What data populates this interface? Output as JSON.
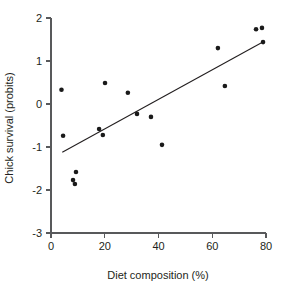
{
  "chart_data": {
    "type": "scatter",
    "title": "",
    "xlabel": "Diet composition (%)",
    "ylabel": "Chick survival (probits)",
    "xlim": [
      0,
      80
    ],
    "ylim": [
      -3,
      2
    ],
    "xticks": [
      0,
      20,
      40,
      60,
      80
    ],
    "xtick_labels": [
      "0",
      "20",
      "40",
      "60",
      "80"
    ],
    "yticks": [
      2,
      1,
      0,
      -1,
      -2,
      -3
    ],
    "ytick_labels": [
      "2",
      "1",
      "0",
      "-1",
      "-2",
      "-3"
    ],
    "grid": false,
    "legend": null,
    "points": [
      {
        "x": 3.9,
        "y": 0.33
      },
      {
        "x": 4.5,
        "y": -0.74
      },
      {
        "x": 8.2,
        "y": -1.77
      },
      {
        "x": 8.9,
        "y": -1.86
      },
      {
        "x": 9.3,
        "y": -1.58
      },
      {
        "x": 17.9,
        "y": -0.58
      },
      {
        "x": 19.3,
        "y": -0.72
      },
      {
        "x": 20.1,
        "y": 0.49
      },
      {
        "x": 28.6,
        "y": 0.26
      },
      {
        "x": 32.0,
        "y": -0.23
      },
      {
        "x": 37.2,
        "y": -0.3
      },
      {
        "x": 41.3,
        "y": -0.95
      },
      {
        "x": 62.1,
        "y": 1.3
      },
      {
        "x": 64.7,
        "y": 0.42
      },
      {
        "x": 76.3,
        "y": 1.74
      },
      {
        "x": 78.5,
        "y": 1.77
      },
      {
        "x": 78.9,
        "y": 1.44
      }
    ],
    "fit_line": {
      "label": "",
      "x_start": 4.2,
      "y_start": -1.12,
      "x_end": 79.0,
      "y_end": 1.45
    },
    "marker": {
      "shape": "circle",
      "size": 4.6,
      "color": "#1a1a1a"
    },
    "colors": {
      "axis": "#58595b",
      "text": "#231f20",
      "line": "#231f20",
      "background": "#ffffff"
    }
  }
}
